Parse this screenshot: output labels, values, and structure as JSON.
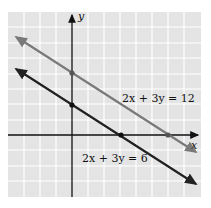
{
  "diagram": {
    "axes": {
      "x_label": "x",
      "y_label": "y"
    },
    "lines": [
      {
        "equation": "2x + 3y = 12",
        "color": "#7a7a7a",
        "x_intercept": 6,
        "y_intercept": 4
      },
      {
        "equation": "2x + 3y = 6",
        "color": "#222222",
        "x_intercept": 3,
        "y_intercept": 2
      }
    ],
    "colors": {
      "grid_bg": "#e4e4e4",
      "grid_line": "#ffffff",
      "axis": "#111111"
    }
  }
}
